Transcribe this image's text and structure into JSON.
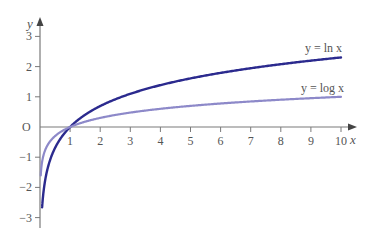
{
  "chart_data": {
    "type": "line",
    "title": "",
    "xlabel": "x",
    "ylabel": "y",
    "xlim": [
      0,
      10
    ],
    "ylim": [
      -3,
      3
    ],
    "origin_label": "O",
    "x_ticks": [
      1,
      2,
      3,
      4,
      5,
      6,
      7,
      8,
      9,
      10
    ],
    "y_ticks": [
      -3,
      -2,
      -1,
      1,
      2,
      3
    ],
    "grid": false,
    "series": [
      {
        "name": "y = ln x",
        "function": "ln",
        "color": "#2b2a8e",
        "x_start": 0.07,
        "x_end": 10,
        "points": [
          [
            0.07,
            -2.66
          ],
          [
            0.1,
            -2.3
          ],
          [
            0.25,
            -1.39
          ],
          [
            0.5,
            -0.69
          ],
          [
            1,
            0
          ],
          [
            2,
            0.69
          ],
          [
            3,
            1.1
          ],
          [
            4,
            1.39
          ],
          [
            5,
            1.61
          ],
          [
            6,
            1.79
          ],
          [
            7,
            1.95
          ],
          [
            8,
            2.08
          ],
          [
            9,
            2.2
          ],
          [
            10,
            2.3
          ]
        ]
      },
      {
        "name": "y = log x",
        "function": "log10",
        "color": "#8d89c9",
        "x_start": 0.025,
        "x_end": 10,
        "points": [
          [
            0.025,
            -1.6
          ],
          [
            0.1,
            -1.0
          ],
          [
            0.25,
            -0.6
          ],
          [
            0.5,
            -0.3
          ],
          [
            1,
            0
          ],
          [
            2,
            0.3
          ],
          [
            3,
            0.48
          ],
          [
            4,
            0.6
          ],
          [
            5,
            0.7
          ],
          [
            6,
            0.78
          ],
          [
            7,
            0.85
          ],
          [
            8,
            0.9
          ],
          [
            9,
            0.95
          ],
          [
            10,
            1.0
          ]
        ]
      }
    ],
    "annotations": [
      {
        "text": "y = ln x",
        "x": 9.4,
        "y": 2.7
      },
      {
        "text": "y = log x",
        "x": 9.3,
        "y": 1.25
      }
    ]
  },
  "labels": {
    "x_axis": "x",
    "y_axis": "y",
    "origin": "O",
    "ln_label": "y = ln x",
    "log_label": "y = log x"
  }
}
